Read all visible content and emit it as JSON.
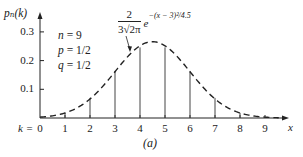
{
  "figure": {
    "y_axis_label": "pₙ(k)",
    "x_axis_label": "x",
    "k_prefix": "k = ",
    "caption": "(a)",
    "params": [
      {
        "name": "n",
        "eq": " = ",
        "value": "9"
      },
      {
        "name": "p",
        "eq": " = ",
        "value": "1/2"
      },
      {
        "name": "q",
        "eq": " = ",
        "value": "1/2"
      }
    ],
    "formula": {
      "numerator": "2",
      "denominator": "3√2π",
      "base": "e",
      "exponent": "−(x − 3)²/4.5"
    },
    "colors": {
      "ink": "#222222",
      "background": "#ffffff"
    }
  },
  "chart_data": {
    "type": "bar",
    "title": "",
    "xlabel": "x",
    "ylabel": "pₙ(k)",
    "categories": [
      "0",
      "1",
      "2",
      "3",
      "4",
      "5",
      "6",
      "7",
      "8",
      "9"
    ],
    "series": [
      {
        "name": "Binomial pₙ(k), n=9, p=1/2 (stems)",
        "style": "vertical lines",
        "values": [
          0.002,
          0.018,
          0.07,
          0.164,
          0.246,
          0.246,
          0.164,
          0.07,
          0.018,
          0.002
        ]
      },
      {
        "name": "Normal approximation 2/(3√2π)·e^{−(x−4.5)²/4.5}",
        "style": "dashed curve",
        "x": [
          0,
          1,
          2,
          3,
          4,
          4.5,
          5,
          6,
          7,
          8,
          9
        ],
        "values": [
          0.0029,
          0.0176,
          0.0665,
          0.161,
          0.2501,
          0.266,
          0.2501,
          0.161,
          0.0665,
          0.0176,
          0.0029
        ]
      }
    ],
    "y_ticks": [
      "0.1",
      "0.2",
      "0.3"
    ],
    "x_ticks": [
      "0",
      "1",
      "2",
      "3",
      "4",
      "5",
      "6",
      "7",
      "8",
      "9"
    ],
    "xlim": [
      0,
      9.5
    ],
    "ylim": [
      0,
      0.35
    ],
    "grid": false,
    "legend": "none",
    "annotations": [
      "n = 9",
      "p = 1/2",
      "q = 1/2",
      "2/(3√2π) e^{−(x − 3)²/4.5}",
      "(a)"
    ]
  }
}
